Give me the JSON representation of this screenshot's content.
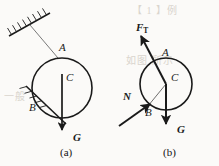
{
  "figure": {
    "background_color": "#fbfaf8",
    "ink_color": "#1a1a1a",
    "width": 219,
    "height": 166,
    "panels": [
      {
        "id": "panel-a",
        "caption": "(a)",
        "description": "Ball hanging by a string from a hatched ceiling, resting against a hatched inclined wall",
        "circle": {
          "cx": 62,
          "cy": 88,
          "r": 30
        },
        "labels": [
          {
            "name": "point-a",
            "text": "A",
            "bold": false,
            "x": 59,
            "y": 47
          },
          {
            "name": "point-b",
            "text": "B",
            "bold": false,
            "x": 30,
            "y": 107
          },
          {
            "name": "point-c",
            "text": "C",
            "bold": false,
            "x": 66,
            "y": 78
          },
          {
            "name": "force-g",
            "text": "G",
            "bold": true,
            "x": 74,
            "y": 137
          }
        ],
        "forces": [
          {
            "name": "weight",
            "symbol": "G",
            "direction": "down"
          }
        ],
        "supports": [
          {
            "name": "ceiling",
            "type": "hatched-line"
          },
          {
            "name": "incline",
            "type": "hatched-line"
          },
          {
            "name": "string",
            "type": "thin-line",
            "from": "ceiling",
            "to": "A"
          }
        ]
      },
      {
        "id": "panel-b",
        "caption": "(b)",
        "description": "Free-body diagram of the ball with tension, normal force and weight",
        "circle": {
          "cx": 166,
          "cy": 84,
          "r": 26
        },
        "labels": [
          {
            "name": "point-a",
            "text": "A",
            "bold": false,
            "x": 163,
            "y": 52
          },
          {
            "name": "point-b",
            "text": "B",
            "bold": false,
            "x": 146,
            "y": 112
          },
          {
            "name": "point-c",
            "text": "C",
            "bold": false,
            "x": 171,
            "y": 77
          },
          {
            "name": "force-ft",
            "text": "F",
            "subscript": "T",
            "bold": true,
            "x": 137,
            "y": 27
          },
          {
            "name": "force-n",
            "text": "N",
            "bold": true,
            "x": 124,
            "y": 96
          },
          {
            "name": "force-g",
            "text": "G",
            "bold": true,
            "x": 180,
            "y": 128
          }
        ],
        "forces": [
          {
            "name": "tension",
            "symbol": "FT",
            "direction": "up-left"
          },
          {
            "name": "normal",
            "symbol": "N",
            "direction": "up-right"
          },
          {
            "name": "weight",
            "symbol": "G",
            "direction": "down"
          }
        ]
      }
    ],
    "ghost_text": [
      {
        "name": "ghost-heading",
        "text": "【 1 】例",
        "x": 132,
        "y": 12
      },
      {
        "name": "ghost-line-left",
        "text": "一般",
        "x": 6,
        "y": 96
      },
      {
        "name": "ghost-line-right",
        "text": "如图 所示",
        "x": 128,
        "y": 62
      }
    ]
  }
}
